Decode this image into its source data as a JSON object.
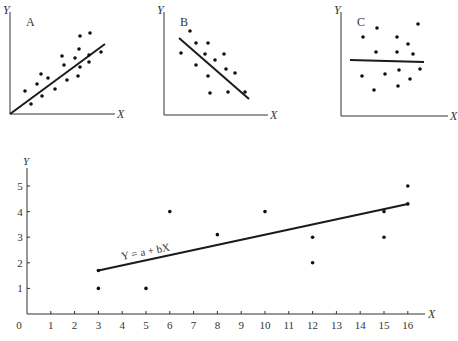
{
  "chart_data": [
    {
      "type": "scatter",
      "title": "A",
      "xlabel": "X",
      "ylabel": "Y",
      "description": "Positive correlation",
      "axes_px": {
        "origin": [
          10,
          114
        ],
        "x_end": [
          115,
          114
        ],
        "y_end": [
          10,
          12
        ]
      },
      "line_px": [
        [
          10,
          114
        ],
        [
          105,
          44
        ]
      ],
      "points_px": [
        [
          25,
          91
        ],
        [
          31,
          104
        ],
        [
          37,
          84
        ],
        [
          41,
          74
        ],
        [
          42,
          96
        ],
        [
          48,
          78
        ],
        [
          55,
          89
        ],
        [
          62,
          56
        ],
        [
          64,
          65
        ],
        [
          67,
          80
        ],
        [
          75,
          58
        ],
        [
          79,
          49
        ],
        [
          78,
          76
        ],
        [
          80,
          67
        ],
        [
          80,
          36
        ],
        [
          89,
          55
        ],
        [
          89,
          62
        ],
        [
          101,
          52
        ],
        [
          90,
          33
        ]
      ]
    },
    {
      "type": "scatter",
      "title": "B",
      "xlabel": "X",
      "ylabel": "Y",
      "description": "Negative correlation",
      "axes_px": {
        "origin": [
          164,
          115
        ],
        "x_end": [
          268,
          115
        ],
        "y_end": [
          164,
          12
        ]
      },
      "line_px": [
        [
          179,
          38
        ],
        [
          249,
          99
        ]
      ],
      "points_px": [
        [
          190,
          31
        ],
        [
          181,
          53
        ],
        [
          196,
          43
        ],
        [
          208,
          43
        ],
        [
          205,
          54
        ],
        [
          196,
          65
        ],
        [
          215,
          60
        ],
        [
          224,
          54
        ],
        [
          208,
          76
        ],
        [
          226,
          69
        ],
        [
          235,
          73
        ],
        [
          210,
          93
        ],
        [
          228,
          92
        ],
        [
          245,
          92
        ]
      ]
    },
    {
      "type": "scatter",
      "title": "C",
      "xlabel": "X",
      "ylabel": "Y",
      "description": "No correlation",
      "axes_px": {
        "origin": [
          341,
          116
        ],
        "x_end": [
          448,
          116
        ],
        "y_end": [
          341,
          12
        ]
      },
      "line_px": [
        [
          350,
          60
        ],
        [
          424,
          62
        ]
      ],
      "points_px": [
        [
          363,
          37
        ],
        [
          377,
          28
        ],
        [
          418,
          24
        ],
        [
          362,
          76
        ],
        [
          376,
          52
        ],
        [
          397,
          37
        ],
        [
          408,
          44
        ],
        [
          397,
          52
        ],
        [
          413,
          54
        ],
        [
          385,
          74
        ],
        [
          399,
          70
        ],
        [
          420,
          69
        ],
        [
          410,
          79
        ],
        [
          374,
          90
        ],
        [
          398,
          86
        ]
      ]
    },
    {
      "type": "scatter",
      "title": "",
      "xlabel": "X",
      "ylabel": "Y",
      "x_ticks": [
        0,
        1,
        2,
        3,
        4,
        5,
        6,
        7,
        8,
        9,
        10,
        11,
        12,
        13,
        14,
        15,
        16
      ],
      "y_ticks": [
        1,
        2,
        3,
        4,
        5
      ],
      "xlim": [
        0,
        16.7
      ],
      "ylim": [
        0,
        5.6
      ],
      "grid": false,
      "points": [
        {
          "x": 3,
          "y": 1.7
        },
        {
          "x": 3,
          "y": 1
        },
        {
          "x": 5,
          "y": 1
        },
        {
          "x": 6,
          "y": 4
        },
        {
          "x": 8,
          "y": 3.1
        },
        {
          "x": 10,
          "y": 4
        },
        {
          "x": 12,
          "y": 3
        },
        {
          "x": 12,
          "y": 2
        },
        {
          "x": 15,
          "y": 4
        },
        {
          "x": 15,
          "y": 3
        },
        {
          "x": 16,
          "y": 5
        },
        {
          "x": 16,
          "y": 4.3
        }
      ],
      "regression_line": {
        "from": {
          "x": 3,
          "y": 1.7
        },
        "to": {
          "x": 16,
          "y": 4.3
        }
      },
      "annotation": "Y = a + bX"
    }
  ]
}
